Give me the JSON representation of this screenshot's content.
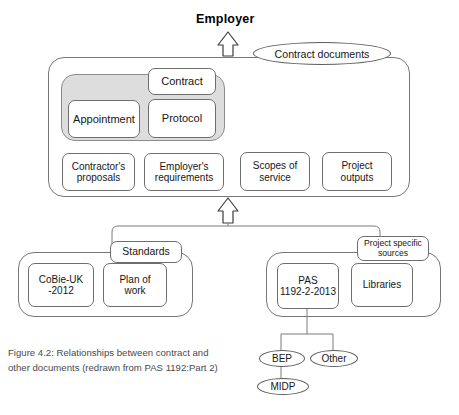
{
  "figure": {
    "top_label": "Employer",
    "caption": "Figure 4.2: Relationships between contract and other documents (redrawn from PAS 1192:Part 2)"
  },
  "contract_documents": {
    "label": "Contract documents",
    "shaded_group_name": "appointment-protocol-group",
    "nodes": {
      "contract": "Contract",
      "appointment": "Appointment",
      "protocol": "Protocol",
      "contractors_proposals": "Contractor's\nproposals",
      "employers_requirements": "Employer's\nrequirements",
      "scopes_of_service": "Scopes of\nservice",
      "project_outputs": "Project\noutputs"
    }
  },
  "standards": {
    "label": "Standards",
    "nodes": {
      "cobie": "CoBie-UK\n-2012",
      "plan_of_work": "Plan of\nwork"
    }
  },
  "project_specific_sources": {
    "label": "Project specific\nsources",
    "nodes": {
      "pas": "PAS\n1192-2-2013",
      "libraries": "Libraries"
    },
    "children": {
      "bep": "BEP",
      "other": "Other",
      "midp": "MIDP"
    }
  },
  "icons": {
    "arrow_up_employer": "block-arrow-up-icon",
    "arrow_up_sources": "block-arrow-up-icon"
  },
  "colors": {
    "stroke": "#6e6e6e",
    "shaded_fill": "#dddddd",
    "text": "#161616",
    "caption": "#4a4a4a",
    "background": "#ffffff"
  }
}
